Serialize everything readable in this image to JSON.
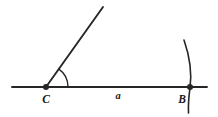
{
  "figure": {
    "kind": "geometric-construction-diagram",
    "width": 218,
    "height": 117,
    "background_color": "#ffffff",
    "stroke_color": "#262626",
    "label_color": "#1a1a1a"
  },
  "labels": {
    "vertex_c": "C",
    "vertex_b": "B",
    "segment_a": "a"
  },
  "points": [
    {
      "name": "C",
      "label": "C",
      "x": 46,
      "y": 87,
      "marker": "filled-dot",
      "radius": 3.0
    },
    {
      "name": "B",
      "label": "B",
      "x": 190,
      "y": 87,
      "marker": "filled-dot",
      "radius": 3.0
    }
  ],
  "lines": [
    {
      "name": "base-line",
      "description": "horizontal working line through C and B",
      "x1": 12,
      "y1": 87,
      "x2": 207,
      "y2": 87,
      "stroke_width": 1.9
    },
    {
      "name": "angle-ray",
      "description": "ray from vertex C rising to the upper right",
      "x1": 46,
      "y1": 87,
      "x2": 103,
      "y2": 7,
      "stroke_width": 1.9
    }
  ],
  "arcs": [
    {
      "name": "angle-arc-at-c",
      "description": "small arc marking the angle at vertex C",
      "path": "M 68 87 A 22 22 0 0 0 58.6 68.9",
      "stroke_width": 1.4
    },
    {
      "name": "compass-arc-through-b",
      "description": "compass arc crossing the base line at point B",
      "path": "M 184 40 Q 193 66 190 88 Q 188 102 188.5 113",
      "stroke_width": 1.6
    }
  ],
  "label_positions": {
    "vertex_c": {
      "x": 46,
      "y": 103,
      "font_size": 11.5,
      "anchor": "middle"
    },
    "vertex_b": {
      "x": 182,
      "y": 103,
      "font_size": 11.5,
      "anchor": "middle"
    },
    "segment_a": {
      "x": 118,
      "y": 99,
      "font_size": 10.5,
      "anchor": "middle"
    }
  }
}
